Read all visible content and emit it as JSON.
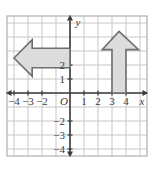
{
  "figure": {
    "name": "coordinate-plane-with-two-arrow-shapes",
    "background_color": "#ffffff",
    "grid": {
      "line_color": "#c7c7c7",
      "border_color": "#b0b0b0",
      "cell_size_px": 14,
      "x_min": -4.5,
      "x_max": 5.5,
      "y_min": -4.5,
      "y_max": 5.5,
      "show_grid": true
    },
    "axes": {
      "axis_color": "#3b3b3b",
      "x_axis_label": "x",
      "y_axis_label": "y",
      "origin_label": "O",
      "x_tick_labels": [
        "−4",
        "−3",
        "−2",
        "1",
        "2",
        "3",
        "4"
      ],
      "x_tick_values": [
        -4,
        -3,
        -2,
        1,
        2,
        3,
        4
      ],
      "y_tick_labels": [
        "2",
        "1",
        "−2",
        "−3",
        "−4"
      ],
      "y_tick_values": [
        2,
        1,
        -2,
        -3,
        -4
      ],
      "arrowheads": [
        "left",
        "right",
        "up",
        "down"
      ]
    },
    "shapes": [
      {
        "name": "left-pointing-arrow",
        "direction": "left",
        "fill_color": "#dcdcdc",
        "stroke_color": "#6e6e6e",
        "stroke_width": 1.6,
        "points": [
          [
            -4.0,
            2.5
          ],
          [
            -2.7,
            3.8
          ],
          [
            -2.7,
            3.2
          ],
          [
            0.0,
            3.2
          ],
          [
            0.0,
            1.8
          ],
          [
            -2.7,
            1.8
          ],
          [
            -2.7,
            1.2
          ]
        ]
      },
      {
        "name": "up-pointing-arrow",
        "direction": "up",
        "fill_color": "#dcdcdc",
        "stroke_color": "#6e6e6e",
        "stroke_width": 1.6,
        "points": [
          [
            3.5,
            4.4
          ],
          [
            4.9,
            3.1
          ],
          [
            4.0,
            3.1
          ],
          [
            4.0,
            0.0
          ],
          [
            3.0,
            0.0
          ],
          [
            3.0,
            3.1
          ],
          [
            2.3,
            3.1
          ]
        ]
      }
    ]
  }
}
